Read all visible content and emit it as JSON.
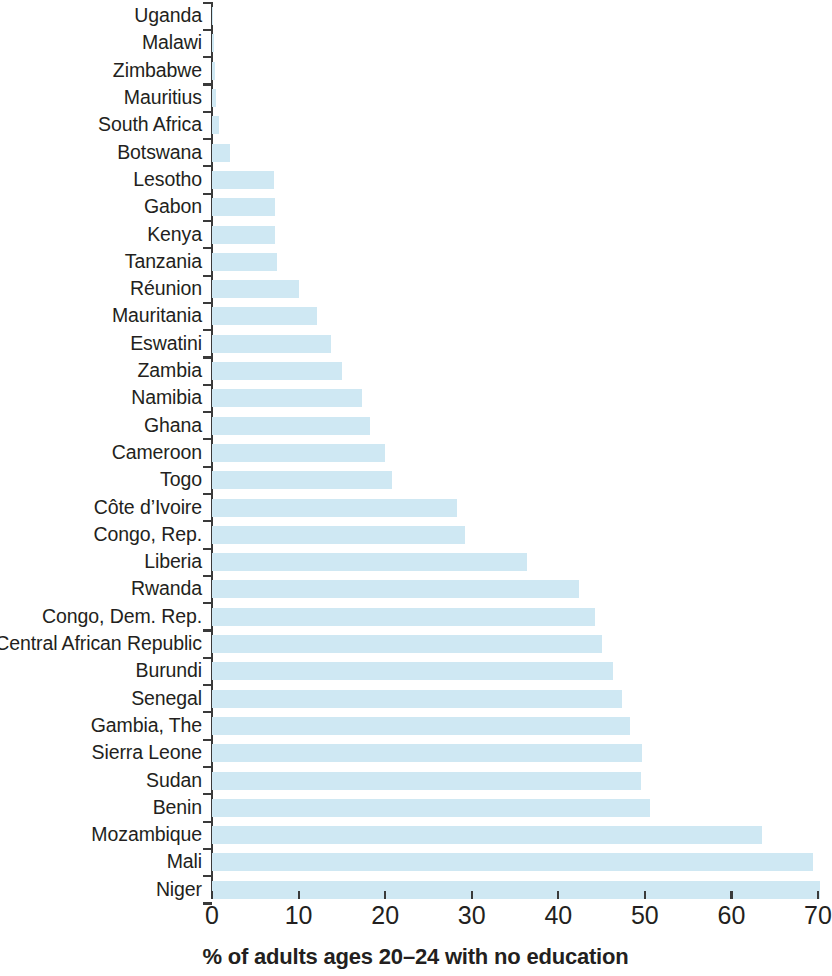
{
  "chart_data": {
    "type": "bar",
    "orientation": "horizontal",
    "title": "",
    "xlabel": "% of adults ages 20–24 with no education",
    "ylabel": "",
    "xlim": [
      0,
      70
    ],
    "xticks": [
      0,
      10,
      20,
      30,
      40,
      50,
      60,
      70
    ],
    "xtick_labels": [
      "0",
      "10",
      "20",
      "30",
      "40",
      "50",
      "60",
      "70"
    ],
    "grid": false,
    "legend": null,
    "bar_color": "#cfe8f3",
    "axis_color": "#3a3a3a",
    "text_color": "#231f20",
    "categories": [
      "Uganda",
      "Malawi",
      "Zimbabwe",
      "Mauritius",
      "South Africa",
      "Botswana",
      "Lesotho",
      "Gabon",
      "Kenya",
      "Tanzania",
      "Réunion",
      "Mauritania",
      "Eswatini",
      "Zambia",
      "Namibia",
      "Ghana",
      "Cameroon",
      "Togo",
      "Côte d’Ivoire",
      "Congo, Rep.",
      "Liberia",
      "Rwanda",
      "Congo, Dem. Rep.",
      "Central African Republic",
      "Burundi",
      "Senegal",
      "Gambia, The",
      "Sierra Leone",
      "Sudan",
      "Benin",
      "Mozambique",
      "Mali",
      "Niger"
    ],
    "values": [
      0.1,
      0.2,
      0.3,
      0.5,
      0.8,
      2.1,
      7.2,
      7.3,
      7.3,
      7.5,
      10.0,
      12.1,
      13.8,
      15.0,
      17.3,
      18.2,
      20.0,
      20.8,
      28.3,
      29.2,
      36.4,
      42.4,
      44.2,
      45.0,
      46.3,
      47.4,
      48.3,
      49.7,
      49.5,
      50.6,
      63.5,
      69.4,
      70.2
    ]
  }
}
